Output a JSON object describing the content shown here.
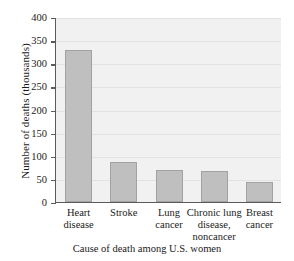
{
  "chart_data": {
    "type": "bar",
    "title": "",
    "xlabel": "Cause of death among U.S. women",
    "ylabel": "Number of deaths (thousands)",
    "categories": [
      "Heart\ndisease",
      "Stroke",
      "Lung\ncancer",
      "Chronic lung\ndisease,\nnoncancer",
      "Breast\ncancer"
    ],
    "values": [
      328,
      87,
      70,
      68,
      44
    ],
    "ylim": [
      0,
      400
    ],
    "yticks": [
      0,
      50,
      100,
      150,
      200,
      250,
      300,
      350,
      400
    ],
    "ytick_labels": [
      "0",
      "50",
      "100",
      "150",
      "200",
      "250",
      "300",
      "350",
      "400"
    ],
    "grid": true,
    "legend": null,
    "bar_color": "#bfbfbf",
    "bar_edge_color": "#a2a2a2",
    "plot_background": "#f1f1f1",
    "axis_color": "#5b5b5b",
    "gridline_color": "#e2e2e2"
  }
}
